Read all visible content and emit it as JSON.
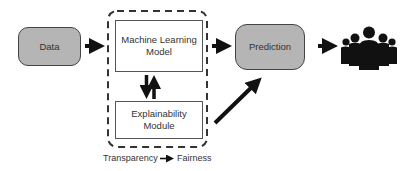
{
  "diagram": {
    "nodes": {
      "data": {
        "label": "Data"
      },
      "ml_model": {
        "label_line1": "Machine Learning",
        "label_line2": "Model"
      },
      "explainability": {
        "label_line1": "Explainability",
        "label_line2": "Module"
      },
      "prediction": {
        "label": "Prediction"
      }
    },
    "caption": {
      "left": "Transparency",
      "right": "Fairness"
    },
    "icons": {
      "users": "people-group-icon"
    },
    "colors": {
      "node_fill": "#b5b5b5",
      "arrow": "#111111",
      "dashed_border": "#333333"
    }
  }
}
